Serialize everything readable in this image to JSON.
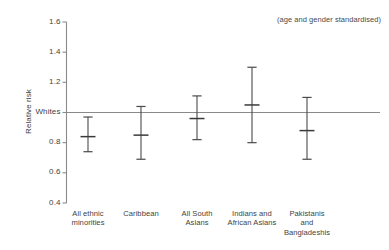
{
  "chart_data": {
    "type": "scatter",
    "title": "",
    "subtitle": "",
    "annotation": "(age and gender standardised)",
    "xlabel": "",
    "ylabel": "Relative risk",
    "ylim": [
      0.4,
      1.6
    ],
    "grid": false,
    "legend": null,
    "reference_line": {
      "label": "Whites",
      "value": 1.0
    },
    "ytick_values": [
      1.6,
      1.4,
      1.2,
      1.0,
      0.8,
      0.6,
      0.4
    ],
    "ytick_labels": [
      "1.6",
      "1.4",
      "1.2",
      "Whites",
      "0.8",
      "0.6",
      "0.4"
    ],
    "categories": [
      "All ethnic\nminorities",
      "Caribbean",
      "All South\nAsians",
      "Indians and\nAfrican Asians",
      "Pakistanis\nand\nBangladeshis"
    ],
    "values": [
      0.84,
      0.85,
      0.96,
      1.05,
      0.88
    ],
    "error_low": [
      0.74,
      0.69,
      0.82,
      0.8,
      0.69
    ],
    "error_high": [
      0.97,
      1.04,
      1.11,
      1.3,
      1.1
    ],
    "series": [
      {
        "name": "Relative risk",
        "points": [
          {
            "category": "All ethnic minorities",
            "value": 0.84,
            "ci_low": 0.74,
            "ci_high": 0.97
          },
          {
            "category": "Caribbean",
            "value": 0.85,
            "ci_low": 0.69,
            "ci_high": 1.04
          },
          {
            "category": "All South Asians",
            "value": 0.96,
            "ci_low": 0.82,
            "ci_high": 1.11
          },
          {
            "category": "Indians and African Asians",
            "value": 1.05,
            "ci_low": 0.8,
            "ci_high": 1.3
          },
          {
            "category": "Pakistanis and Bangladeshis",
            "value": 0.88,
            "ci_low": 0.69,
            "ci_high": 1.1
          }
        ]
      }
    ],
    "colors": {
      "marker": "#3a3a3a",
      "errorbar": "#4a4a4a",
      "axis": "#8a8a8a",
      "reference_line": "#8a8a8a",
      "text": "#3f3f3f",
      "background": "#ffffff"
    }
  },
  "axis": {
    "ylabel": "Relative risk",
    "ticks": [
      {
        "label": "1.6"
      },
      {
        "label": "1.4"
      },
      {
        "label": "1.2"
      },
      {
        "label": "Whites"
      },
      {
        "label": "0.8"
      },
      {
        "label": "0.6"
      },
      {
        "label": "0.4"
      }
    ]
  },
  "categories": [
    {
      "label": "All ethnic\nminorities"
    },
    {
      "label": "Caribbean"
    },
    {
      "label": "All South\nAsians"
    },
    {
      "label": "Indians and\nAfrican Asians"
    },
    {
      "label": "Pakistanis\nand\nBangladeshis"
    }
  ],
  "annotation": {
    "text": "(age and gender standardised)"
  }
}
